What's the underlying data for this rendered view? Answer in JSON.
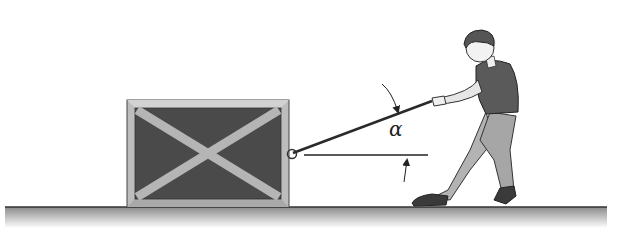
{
  "diagram": {
    "angle_label": "α",
    "elements": {
      "crate": {
        "label": "crate",
        "fill": "#4a4a4a",
        "frame": "#b8b8b8"
      },
      "rope": {
        "label": "rope",
        "color": "#2a2a2a"
      },
      "reference_line": {
        "label": "horizontal reference line"
      },
      "person": {
        "label": "person pulling",
        "shirt": "#555555",
        "pants": "#b0b0b0"
      },
      "floor": {
        "label": "floor",
        "color": "#9a9a9a"
      }
    },
    "colors": {
      "background": "#ffffff",
      "outline": "#222222",
      "crate_dark": "#4a4a4a",
      "crate_frame": "#bdbdbd",
      "floor": "#a8a8a8"
    }
  }
}
